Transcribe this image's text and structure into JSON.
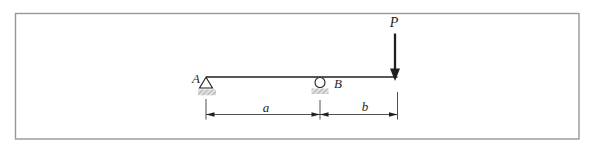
{
  "figure": {
    "type": "simply-supported-beam-with-overhang-and-point-load",
    "labels": {
      "support_left": "A",
      "support_right": "B",
      "load": "P",
      "dim_left": "a",
      "dim_right": "b"
    },
    "colors": {
      "line": "#1f1f1f",
      "frame": "#979797",
      "thin_line": "#3c3c3c",
      "hatch_line": "#8c8c8c",
      "hatch_bg": "#dedede",
      "background": "#ffffff"
    }
  }
}
